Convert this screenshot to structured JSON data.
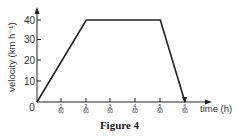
{
  "caption": "Figure 4",
  "chart_data": {
    "type": "line",
    "title": "",
    "xlabel": "time (h)",
    "ylabel": "velocity (km h⁻¹)",
    "x": [
      0,
      0.03333,
      0.08333,
      0.1
    ],
    "x_fraction_labels": [
      "0",
      "2/60",
      "5/60",
      "6/60"
    ],
    "series": [
      {
        "name": "velocity",
        "values": [
          0,
          40,
          40,
          0
        ]
      }
    ],
    "x_ticks": [
      {
        "num": "1",
        "den": "60"
      },
      {
        "num": "2",
        "den": "60"
      },
      {
        "num": "3",
        "den": "60"
      },
      {
        "num": "4",
        "den": "60"
      },
      {
        "num": "5",
        "den": "60"
      },
      {
        "num": "6",
        "den": "60"
      }
    ],
    "y_ticks": [
      "10",
      "20",
      "30",
      "40"
    ],
    "origin_label": "0",
    "xlim": [
      0,
      0.1
    ],
    "ylim": [
      0,
      40
    ],
    "grid": false,
    "legend": "none"
  }
}
